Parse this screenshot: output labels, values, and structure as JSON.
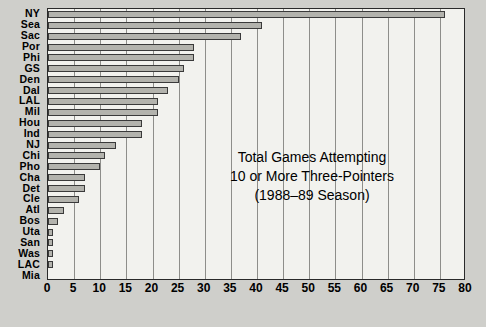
{
  "chart_data": {
    "type": "bar",
    "orientation": "horizontal",
    "title": "",
    "annotation": [
      "Total Games Attempting",
      "10 or More Three-Pointers",
      "(1988–89 Season)"
    ],
    "xlabel": "",
    "ylabel": "",
    "xlim": [
      0,
      80
    ],
    "xticks": [
      0,
      5,
      10,
      15,
      20,
      25,
      30,
      35,
      40,
      45,
      50,
      55,
      60,
      65,
      70,
      75,
      80
    ],
    "grid": true,
    "legend": "none",
    "categories": [
      "NY",
      "Sea",
      "Sac",
      "Por",
      "Phi",
      "GS",
      "Den",
      "Dal",
      "LAL",
      "Mil",
      "Hou",
      "Ind",
      "NJ",
      "Chi",
      "Pho",
      "Cha",
      "Det",
      "Cle",
      "Atl",
      "Bos",
      "Uta",
      "San",
      "Was",
      "LAC",
      "Mia"
    ],
    "values": [
      76,
      41,
      37,
      28,
      28,
      26,
      25,
      23,
      21,
      21,
      18,
      18,
      13,
      11,
      10,
      7,
      7,
      6,
      3,
      2,
      1,
      1,
      1,
      1,
      0
    ],
    "bar_color": "#b3b3ad",
    "bar_edge_color": "#3a3a3a",
    "plot_background": "#f2f2ee",
    "page_background": "#cfcfcb"
  }
}
